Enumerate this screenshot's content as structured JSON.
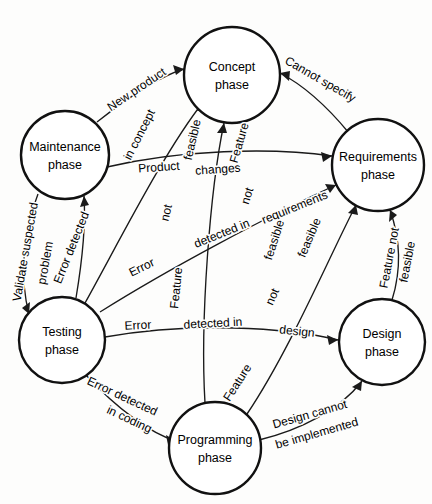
{
  "diagram": {
    "type": "state-transition-diagram",
    "background_color": "#fdfdfc",
    "line_color": "#1a1a1a",
    "node_fill": "#ffffff",
    "nodes": [
      {
        "id": "concept",
        "label_line1": "Concept",
        "label_line2": "phase",
        "cx": 232,
        "cy": 75,
        "r": 48
      },
      {
        "id": "maintenance",
        "label_line1": "Maintenance",
        "label_line2": "phase",
        "cx": 65,
        "cy": 155,
        "r": 44
      },
      {
        "id": "requirements",
        "label_line1": "Requirements",
        "label_line2": "phase",
        "cx": 378,
        "cy": 165,
        "r": 46
      },
      {
        "id": "testing",
        "label_line1": "Testing",
        "label_line2": "phase",
        "cx": 62,
        "cy": 340,
        "r": 43
      },
      {
        "id": "design",
        "label_line1": "Design",
        "label_line2": "phase",
        "cx": 382,
        "cy": 342,
        "r": 43
      },
      {
        "id": "programming",
        "label_line1": "Programming",
        "label_line2": "phase",
        "cx": 215,
        "cy": 448,
        "r": 46
      }
    ],
    "edges": [
      {
        "id": "maintenance-to-concept",
        "from": "maintenance",
        "to": "concept",
        "label": "New product"
      },
      {
        "id": "testing-to-concept",
        "from": "testing",
        "to": "concept",
        "label": "Error detected in concept"
      },
      {
        "id": "programming-to-concept",
        "from": "programming",
        "to": "concept",
        "label": "Feature not feasible"
      },
      {
        "id": "requirements-to-concept",
        "from": "requirements",
        "to": "concept",
        "label": "Cannot specify"
      },
      {
        "id": "maintenance-to-requirements",
        "from": "maintenance",
        "to": "requirements",
        "label": "Product changes"
      },
      {
        "id": "testing-to-requirements",
        "from": "testing",
        "to": "requirements",
        "label": "Error detected in requirements"
      },
      {
        "id": "design-to-requirements",
        "from": "design",
        "to": "requirements",
        "label": "Feature not feasible"
      },
      {
        "id": "programming-to-requirements",
        "from": "programming",
        "to": "requirements",
        "label": "Feature not feasible"
      },
      {
        "id": "maintenance-to-testing",
        "from": "maintenance",
        "to": "testing",
        "label": "Validate suspected problem"
      },
      {
        "id": "testing-to-maintenance",
        "from": "testing",
        "to": "maintenance",
        "label": "Error detected"
      },
      {
        "id": "testing-to-design",
        "from": "testing",
        "to": "design",
        "label": "Error detected in design"
      },
      {
        "id": "testing-to-programming",
        "from": "testing",
        "to": "programming",
        "label": "Error detected in coding"
      },
      {
        "id": "programming-to-design",
        "from": "programming",
        "to": "design",
        "label": "Design cannot be implemented"
      }
    ],
    "label_fragments": [
      {
        "id": "frag-new-product",
        "text": "New product",
        "x": 137,
        "y": 90,
        "rotate": -34
      },
      {
        "id": "frag-in-concept",
        "text": "in concept",
        "x": 140,
        "y": 135,
        "rotate": -63
      },
      {
        "id": "frag-feasible-a",
        "text": "feasible",
        "x": 193,
        "y": 140,
        "rotate": -77
      },
      {
        "id": "frag-cannot-specify",
        "text": "Cannot specify",
        "x": 320,
        "y": 80,
        "rotate": 30
      },
      {
        "id": "frag-product",
        "text": "Product",
        "x": 159,
        "y": 168,
        "rotate": -4
      },
      {
        "id": "frag-changes",
        "text": "changes",
        "x": 218,
        "y": 170,
        "rotate": -4
      },
      {
        "id": "frag-feature",
        "text": "Feature",
        "x": 240,
        "y": 143,
        "rotate": -74
      },
      {
        "id": "frag-not-a",
        "text": "not",
        "x": 167,
        "y": 213,
        "rotate": -77
      },
      {
        "id": "frag-not-b",
        "text": "not",
        "x": 248,
        "y": 196,
        "rotate": -73
      },
      {
        "id": "frag-requirements",
        "text": "requirements",
        "x": 295,
        "y": 208,
        "rotate": -22
      },
      {
        "id": "frag-error-a",
        "text": "Error",
        "x": 142,
        "y": 268,
        "rotate": -26
      },
      {
        "id": "frag-detected-in-a",
        "text": "detected in",
        "x": 222,
        "y": 234,
        "rotate": -22
      },
      {
        "id": "frag-feasible-b",
        "text": "feasible",
        "x": 275,
        "y": 240,
        "rotate": -72
      },
      {
        "id": "frag-feasible-c",
        "text": "feasible",
        "x": 310,
        "y": 238,
        "rotate": -67
      },
      {
        "id": "frag-feature-b",
        "text": "Feature",
        "x": 177,
        "y": 288,
        "rotate": -84
      },
      {
        "id": "frag-feature-not",
        "text": "Feature not",
        "x": 390,
        "y": 258,
        "rotate": -79
      },
      {
        "id": "frag-feasible-d",
        "text": "feasible",
        "x": 408,
        "y": 262,
        "rotate": -79
      },
      {
        "id": "frag-validate",
        "text": "Validate suspected",
        "x": 26,
        "y": 252,
        "rotate": -80
      },
      {
        "id": "frag-problem",
        "text": "problem",
        "x": 46,
        "y": 263,
        "rotate": -80
      },
      {
        "id": "frag-error-detected-v",
        "text": "Error detected",
        "x": 72,
        "y": 248,
        "rotate": -68
      },
      {
        "id": "frag-not-c",
        "text": "not",
        "x": 273,
        "y": 297,
        "rotate": -66
      },
      {
        "id": "frag-error-b",
        "text": "Error",
        "x": 138,
        "y": 326,
        "rotate": -3
      },
      {
        "id": "frag-detected-in-b",
        "text": "detected in",
        "x": 213,
        "y": 324,
        "rotate": -3
      },
      {
        "id": "frag-design",
        "text": "design",
        "x": 297,
        "y": 332,
        "rotate": 6
      },
      {
        "id": "frag-feature-c",
        "text": "Feature",
        "x": 238,
        "y": 383,
        "rotate": -57
      },
      {
        "id": "frag-error-detected-c",
        "text": "Error detected",
        "x": 122,
        "y": 397,
        "rotate": 25
      },
      {
        "id": "frag-in-coding",
        "text": "in coding",
        "x": 129,
        "y": 420,
        "rotate": 25
      },
      {
        "id": "frag-design-cannot",
        "text": "Design cannot",
        "x": 310,
        "y": 415,
        "rotate": -16
      },
      {
        "id": "frag-be-implemented",
        "text": "be implemented",
        "x": 317,
        "y": 434,
        "rotate": -16
      }
    ]
  }
}
